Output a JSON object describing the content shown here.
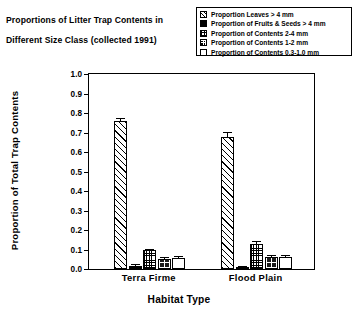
{
  "title": {
    "line1": "Proportions of Litter Trap Contents in",
    "line2": "Different Size Class (collected 1991)"
  },
  "legend": {
    "items": [
      {
        "label": "Proportion Leaves > 4 mm",
        "pattern": "diagonal-hatch",
        "swatch_name": "legend-swatch-leaves"
      },
      {
        "label": "Proportion of Fruits & Seeds > 4 mm",
        "pattern": "solid-black",
        "swatch_name": "legend-swatch-fruits-seeds"
      },
      {
        "label": "Proportion of Contents 2-4 mm",
        "pattern": "fine-dotted",
        "swatch_name": "legend-swatch-contents-2-4mm"
      },
      {
        "label": "Proportion of Contents 1-2 mm",
        "pattern": "dark-crosshatch",
        "swatch_name": "legend-swatch-contents-1-2mm"
      },
      {
        "label": "Proportion of Contents 0.3-1.0 mm",
        "pattern": "open-white",
        "swatch_name": "legend-swatch-contents-03-10mm"
      }
    ]
  },
  "chart_data": {
    "type": "bar",
    "title": "Proportions of Litter Trap Contents in Different Size Class (collected 1991)",
    "xlabel": "Habitat Type",
    "ylabel": "Proportion of Total Trap Contents",
    "categories": [
      "Terra Firme",
      "Flood Plain"
    ],
    "ylim": [
      0.0,
      1.0
    ],
    "yticks": [
      "0.0",
      "0.1",
      "0.2",
      "0.3",
      "0.4",
      "0.5",
      "0.6",
      "0.7",
      "0.8",
      "0.9",
      "1.0"
    ],
    "ytick_values": [
      0.0,
      0.1,
      0.2,
      0.3,
      0.4,
      0.5,
      0.6,
      0.7,
      0.8,
      0.9,
      1.0
    ],
    "grid": false,
    "legend_position": "top-right",
    "error_bars": "standard error",
    "series": [
      {
        "name": "Proportion Leaves > 4 mm",
        "pattern": "diagonal-hatch",
        "values": [
          0.76,
          0.675
        ],
        "errors": [
          0.01,
          0.022
        ]
      },
      {
        "name": "Proportion of Fruits & Seeds > 4 mm",
        "pattern": "solid-black",
        "values": [
          0.017,
          0.005
        ],
        "errors": [
          0.004,
          0.002
        ]
      },
      {
        "name": "Proportion of Contents 2-4 mm",
        "pattern": "fine-dotted",
        "values": [
          0.095,
          0.13
        ],
        "errors": [
          0.005,
          0.009
        ]
      },
      {
        "name": "Proportion of Contents 1-2 mm",
        "pattern": "dark-crosshatch",
        "values": [
          0.052,
          0.063
        ],
        "errors": [
          0.004,
          0.004
        ]
      },
      {
        "name": "Proportion of Contents 0.3-1.0 mm",
        "pattern": "open-white",
        "values": [
          0.057,
          0.061
        ],
        "errors": [
          0.004,
          0.006
        ]
      }
    ]
  },
  "axes": {
    "x_title": "Habitat Type",
    "y_title": "Proportion of Total Trap Contents",
    "group_labels": [
      "Terra Firme",
      "Flood Plain"
    ]
  }
}
